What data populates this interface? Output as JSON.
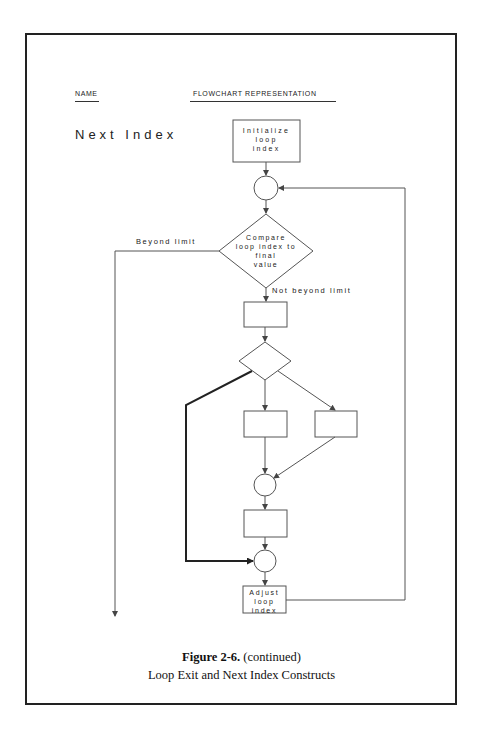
{
  "header": {
    "name_label": "NAME",
    "representation_label": "FLOWCHART REPRESENTATION"
  },
  "construct_title": "Next Index",
  "flowchart": {
    "nodes": [
      {
        "id": "init",
        "type": "process",
        "lines": [
          "Initialize",
          "loop",
          "index"
        ]
      },
      {
        "id": "connector-1",
        "type": "connector"
      },
      {
        "id": "compare",
        "type": "decision",
        "lines": [
          "Compare",
          "loop index to",
          "final",
          "value"
        ]
      },
      {
        "id": "process-1",
        "type": "process",
        "lines": []
      },
      {
        "id": "decision-2",
        "type": "decision",
        "lines": []
      },
      {
        "id": "process-2",
        "type": "process",
        "lines": []
      },
      {
        "id": "process-3",
        "type": "process",
        "lines": []
      },
      {
        "id": "connector-2",
        "type": "connector"
      },
      {
        "id": "process-4",
        "type": "process",
        "lines": []
      },
      {
        "id": "connector-3",
        "type": "connector"
      },
      {
        "id": "adjust",
        "type": "process",
        "lines": [
          "Adjust",
          "loop",
          "index"
        ]
      }
    ],
    "edge_labels": {
      "beyond": "Beyond limit",
      "not_beyond": "Not beyond limit"
    }
  },
  "caption": {
    "figure": "Figure 2-6.",
    "figure_note": "(continued)",
    "title": "Loop Exit and Next Index Constructs"
  }
}
